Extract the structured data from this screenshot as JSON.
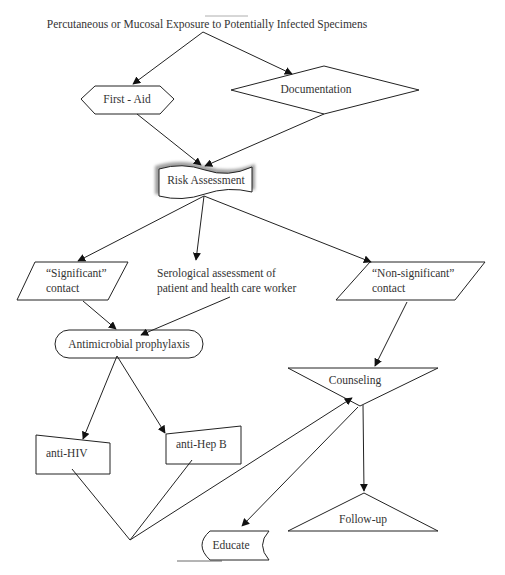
{
  "diagram": {
    "title": "Percutaneous or Mucosal Exposure to Potentially Infected Specimens",
    "nodes": [
      {
        "id": "first_aid",
        "label": "First - Aid",
        "shape": "hexagon"
      },
      {
        "id": "documentation",
        "label": "Documentation",
        "shape": "diamond"
      },
      {
        "id": "risk_assessment",
        "label": "Risk Assessment",
        "shape": "wavy-document"
      },
      {
        "id": "significant",
        "label_line1": "“Significant”",
        "label_line2": "contact",
        "shape": "parallelogram"
      },
      {
        "id": "serological",
        "label_line1": "Serological assessment of",
        "label_line2": "patient and health care worker",
        "shape": "text"
      },
      {
        "id": "non_significant",
        "label_line1": "“Non-significant”",
        "label_line2": "contact",
        "shape": "parallelogram"
      },
      {
        "id": "antimicrobial",
        "label": "Antimicrobial prophylaxis",
        "shape": "stadium"
      },
      {
        "id": "counseling",
        "label": "Counseling",
        "shape": "inverted-triangle"
      },
      {
        "id": "anti_hiv",
        "label": "anti-HIV",
        "shape": "manual-input"
      },
      {
        "id": "anti_hepb",
        "label": "anti-Hep B",
        "shape": "manual-input"
      },
      {
        "id": "educate",
        "label": "Educate",
        "shape": "stored-data"
      },
      {
        "id": "follow_up",
        "label": "Follow-up",
        "shape": "triangle"
      }
    ],
    "edges": [
      {
        "from": "title",
        "to": "first_aid"
      },
      {
        "from": "title",
        "to": "documentation"
      },
      {
        "from": "first_aid",
        "to": "risk_assessment"
      },
      {
        "from": "documentation",
        "to": "risk_assessment"
      },
      {
        "from": "risk_assessment",
        "to": "significant"
      },
      {
        "from": "risk_assessment",
        "to": "serological"
      },
      {
        "from": "risk_assessment",
        "to": "non_significant"
      },
      {
        "from": "significant",
        "to": "antimicrobial"
      },
      {
        "from": "serological",
        "to": "antimicrobial"
      },
      {
        "from": "non_significant",
        "to": "counseling"
      },
      {
        "from": "antimicrobial",
        "to": "anti_hiv"
      },
      {
        "from": "antimicrobial",
        "to": "anti_hepb"
      },
      {
        "from": "anti_hiv+anti_hepb",
        "to": "counseling"
      },
      {
        "from": "counseling",
        "to": "educate"
      },
      {
        "from": "counseling",
        "to": "follow_up"
      }
    ]
  }
}
